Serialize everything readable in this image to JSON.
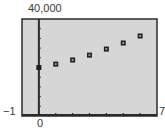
{
  "chart_data": {
    "type": "scatter",
    "title": "",
    "xlabel": "",
    "ylabel": "",
    "x": [
      0,
      1,
      2,
      3,
      4,
      5,
      6
    ],
    "series": [
      {
        "name": "data",
        "values": [
          20000,
          21400,
          23100,
          25100,
          27600,
          30100,
          33000
        ]
      }
    ],
    "xlim": [
      -1,
      7
    ],
    "ylim": [
      0,
      40000
    ],
    "x_tick_step": 1,
    "y_tick_step": 4000,
    "grid": false,
    "legend": "none",
    "window_labels": {
      "ymax": "40,000",
      "xmin": "−1",
      "xmax": "7",
      "origin": "0"
    },
    "colors": {
      "plot_bg": "#d6d6d6",
      "frame": "#2b2b2b",
      "marker": "#1e1e1e"
    }
  }
}
